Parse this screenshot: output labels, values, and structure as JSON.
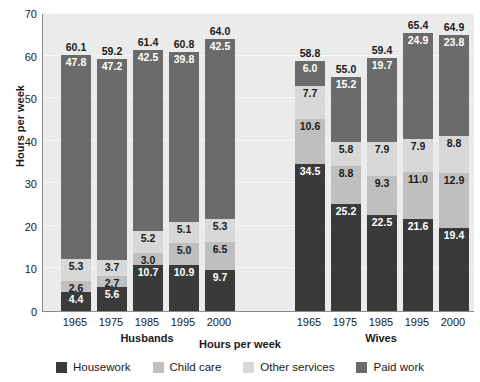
{
  "chart_data": {
    "type": "bar",
    "title": "",
    "xlabel": "Hours per week",
    "ylabel": "Hours per week",
    "ylim": [
      0,
      70
    ],
    "yticks": [
      0,
      10,
      20,
      30,
      40,
      50,
      60,
      70
    ],
    "grid": true,
    "stacked": true,
    "legend_position": "bottom",
    "groups": [
      {
        "name": "Husbands",
        "categories": [
          "1965",
          "1975",
          "1985",
          "1995",
          "2000"
        ]
      },
      {
        "name": "Wives",
        "categories": [
          "1965",
          "1975",
          "1985",
          "1995",
          "2000"
        ]
      }
    ],
    "legend": [
      "Housework",
      "Child care",
      "Other services",
      "Paid work"
    ],
    "series": [
      {
        "name": "Housework",
        "color": "#3a3a3a",
        "values": [
          4.4,
          5.6,
          10.7,
          10.9,
          9.7,
          34.5,
          25.2,
          22.5,
          21.6,
          19.4
        ]
      },
      {
        "name": "Child care",
        "color": "#bfbfbf",
        "values": [
          2.6,
          2.7,
          3.0,
          5.0,
          6.5,
          10.6,
          8.8,
          9.3,
          11.0,
          12.9
        ]
      },
      {
        "name": "Other services",
        "color": "#d8d8d8",
        "values": [
          5.3,
          3.7,
          5.2,
          5.1,
          5.3,
          7.7,
          5.8,
          7.9,
          7.9,
          8.8
        ]
      },
      {
        "name": "Paid work",
        "color": "#6b6b6b",
        "values": [
          47.8,
          47.2,
          42.5,
          39.8,
          42.5,
          6.0,
          15.2,
          19.7,
          24.9,
          23.8
        ]
      }
    ],
    "totals": [
      60.1,
      59.2,
      61.4,
      60.8,
      64.0,
      58.8,
      55.0,
      59.4,
      65.4,
      64.9
    ],
    "total_labels": [
      "60.1",
      "59.2",
      "61.4",
      "60.8",
      "64.0",
      "58.8",
      "55.0",
      "59.4",
      "65.4",
      "64.9"
    ],
    "bars": [
      {
        "group": "Husbands",
        "category": "1965",
        "total": "60.1",
        "segments": [
          {
            "series": "Housework",
            "value": "4.4"
          },
          {
            "series": "Child care",
            "value": "2.6"
          },
          {
            "series": "Other services",
            "value": "5.3"
          },
          {
            "series": "Paid work",
            "value": "47.8"
          }
        ]
      },
      {
        "group": "Husbands",
        "category": "1975",
        "total": "59.2",
        "segments": [
          {
            "series": "Housework",
            "value": "5.6"
          },
          {
            "series": "Child care",
            "value": "2.7"
          },
          {
            "series": "Other services",
            "value": "3.7"
          },
          {
            "series": "Paid work",
            "value": "47.2"
          }
        ]
      },
      {
        "group": "Husbands",
        "category": "1985",
        "total": "61.4",
        "segments": [
          {
            "series": "Housework",
            "value": "10.7"
          },
          {
            "series": "Child care",
            "value": "3.0"
          },
          {
            "series": "Other services",
            "value": "5.2"
          },
          {
            "series": "Paid work",
            "value": "42.5"
          }
        ]
      },
      {
        "group": "Husbands",
        "category": "1995",
        "total": "60.8",
        "segments": [
          {
            "series": "Housework",
            "value": "10.9"
          },
          {
            "series": "Child care",
            "value": "5.0"
          },
          {
            "series": "Other services",
            "value": "5.1"
          },
          {
            "series": "Paid work",
            "value": "39.8"
          }
        ]
      },
      {
        "group": "Husbands",
        "category": "2000",
        "total": "64.0",
        "segments": [
          {
            "series": "Housework",
            "value": "9.7"
          },
          {
            "series": "Child care",
            "value": "6.5"
          },
          {
            "series": "Other services",
            "value": "5.3"
          },
          {
            "series": "Paid work",
            "value": "42.5"
          }
        ]
      },
      {
        "group": "Wives",
        "category": "1965",
        "total": "58.8",
        "segments": [
          {
            "series": "Housework",
            "value": "34.5"
          },
          {
            "series": "Child care",
            "value": "10.6"
          },
          {
            "series": "Other services",
            "value": "7.7"
          },
          {
            "series": "Paid work",
            "value": "6.0"
          }
        ]
      },
      {
        "group": "Wives",
        "category": "1975",
        "total": "55.0",
        "segments": [
          {
            "series": "Housework",
            "value": "25.2"
          },
          {
            "series": "Child care",
            "value": "8.8"
          },
          {
            "series": "Other services",
            "value": "5.8"
          },
          {
            "series": "Paid work",
            "value": "15.2"
          }
        ]
      },
      {
        "group": "Wives",
        "category": "1985",
        "total": "59.4",
        "segments": [
          {
            "series": "Housework",
            "value": "22.5"
          },
          {
            "series": "Child care",
            "value": "9.3"
          },
          {
            "series": "Other services",
            "value": "7.9"
          },
          {
            "series": "Paid work",
            "value": "19.7"
          }
        ]
      },
      {
        "group": "Wives",
        "category": "1995",
        "total": "65.4",
        "segments": [
          {
            "series": "Housework",
            "value": "21.6"
          },
          {
            "series": "Child care",
            "value": "11.0"
          },
          {
            "series": "Other services",
            "value": "7.9"
          },
          {
            "series": "Paid work",
            "value": "24.9"
          }
        ]
      },
      {
        "group": "Wives",
        "category": "2000",
        "total": "64.9",
        "segments": [
          {
            "series": "Housework",
            "value": "19.4"
          },
          {
            "series": "Child care",
            "value": "12.9"
          },
          {
            "series": "Other services",
            "value": "8.8"
          },
          {
            "series": "Paid work",
            "value": "23.8"
          }
        ]
      }
    ],
    "colors": {
      "housework": "#3a3a3a",
      "child_care": "#bfbfbf",
      "other_services": "#d8d8d8",
      "paid_work": "#6b6b6b",
      "plot_background": "#ebebeb",
      "gridline": "#f7f7f7",
      "axis": "#8a8a8a",
      "text": "#1a1a1a"
    }
  }
}
